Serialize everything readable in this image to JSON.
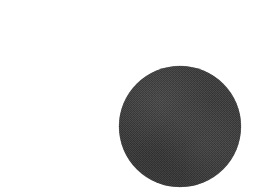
{
  "page": {
    "background_color": "#ffffff",
    "width": 253,
    "height": 195,
    "kind": "scanned-figure",
    "caption": ""
  },
  "figure": {
    "shapes": [
      {
        "name": "filled-circle",
        "type": "circle",
        "fill_color": "#383838",
        "texture": "halftone-dither",
        "center_x": 180,
        "center_y": 126.5,
        "radius": 61,
        "left": 119,
        "top": 66,
        "right": 241,
        "bottom": 187,
        "diameter": 122,
        "label": ""
      }
    ]
  }
}
